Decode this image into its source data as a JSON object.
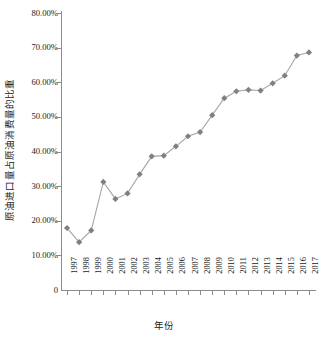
{
  "chart_data": {
    "type": "line",
    "title": "",
    "xlabel": "年份",
    "ylabel": "原油进口量占原油消费量的比重",
    "categories": [
      "1997",
      "1998",
      "1999",
      "2000",
      "2001",
      "2002",
      "2003",
      "2004",
      "2005",
      "2006",
      "2007",
      "2008",
      "2009",
      "2010",
      "2011",
      "2012",
      "2013",
      "2014",
      "2015",
      "2016",
      "2017"
    ],
    "values": [
      17.9,
      13.8,
      17.2,
      31.2,
      26.3,
      27.9,
      33.4,
      38.6,
      38.8,
      41.5,
      44.4,
      45.6,
      50.5,
      55.4,
      57.4,
      57.8,
      57.6,
      59.7,
      61.9,
      67.7,
      68.6
    ],
    "value_unit": "%",
    "ylim": [
      0,
      80
    ],
    "ytick_values": [
      0,
      10,
      20,
      30,
      40,
      50,
      60,
      70,
      80
    ],
    "ytick_labels": [
      "0",
      "10.00%",
      "20.00%",
      "30.00%",
      "40.00%",
      "50.00%",
      "60.00%",
      "70.00%",
      "80.00%"
    ],
    "grid": false,
    "legend": "none",
    "series": [
      {
        "name": "原油进口量占原油消费量的比重",
        "marker": "diamond",
        "marker_color": "#808080",
        "line_color": "#a6a6a6",
        "values": [
          17.9,
          13.8,
          17.2,
          31.2,
          26.3,
          27.9,
          33.4,
          38.6,
          38.8,
          41.5,
          44.4,
          45.6,
          50.5,
          55.4,
          57.4,
          57.8,
          57.6,
          59.7,
          61.9,
          67.7,
          68.6
        ]
      }
    ]
  },
  "colors": {
    "axis": "#8c8c8c",
    "marker": "#808080",
    "line": "#a6a6a6",
    "text": "#1a1a1a",
    "background": "#ffffff"
  }
}
